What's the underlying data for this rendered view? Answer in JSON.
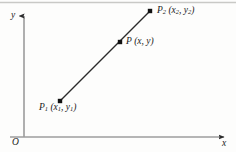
{
  "figure": {
    "type": "coordinate-plane-line-segment",
    "background_color": "#fdfdfc",
    "ink_color": "#1a1a1a",
    "axes": {
      "y_axis_label": "y",
      "x_axis_label": "x",
      "origin_label": "O",
      "y_axis_x_px": 24,
      "x_axis_y_px": 137,
      "y_axis_top_px": 12,
      "x_axis_right_px": 228
    },
    "segment": {
      "from_px": [
        60,
        101
      ],
      "to_px": [
        150,
        11
      ],
      "stroke_color": "#2b2b2b",
      "stroke_width": 1.3
    },
    "points": [
      {
        "name": "P1",
        "label_main": "P",
        "label_sub": "1",
        "coords_text": "(x₁, y₁)",
        "x_px": 60,
        "y_px": 101
      },
      {
        "name": "P",
        "label_main": "P",
        "label_sub": "",
        "coords_text": "(x, y)",
        "x_px": 120,
        "y_px": 42
      },
      {
        "name": "P2",
        "label_main": "P",
        "label_sub": "2",
        "coords_text": "(x₂, y₂)",
        "x_px": 150,
        "y_px": 11
      }
    ],
    "labels": {
      "y": "y",
      "x": "x",
      "origin": "O",
      "p1_name": "P",
      "p1_subscript": "1",
      "p1_coords": "(x",
      "p1_coords_sub1": "1",
      "p1_coords_mid": ", y",
      "p1_coords_sub2": "1",
      "p1_coords_end": ")",
      "p_name": "P",
      "p_coords": "(x, y)",
      "p2_name": "P",
      "p2_subscript": "2",
      "p2_coords": "(x",
      "p2_coords_sub1": "2",
      "p2_coords_mid": ", y",
      "p2_coords_sub2": "2",
      "p2_coords_end": ")"
    }
  }
}
